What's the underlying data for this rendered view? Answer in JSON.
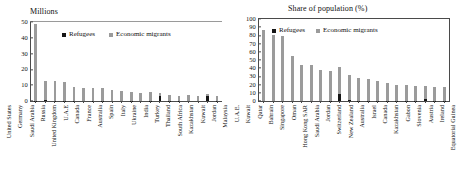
{
  "figure": {
    "legend": {
      "refugees_label": "Refugees",
      "economic_label": "Economic migrants",
      "refugees_color": "#161616",
      "economic_color": "#9b9b9b"
    }
  },
  "chart_data": [
    {
      "type": "bar",
      "title": "Millions",
      "xlabel": "",
      "ylabel": "Millions",
      "ylim": [
        0,
        50
      ],
      "yticks": [
        0,
        10,
        20,
        30,
        40,
        50
      ],
      "grid": false,
      "legend_position": "top-center",
      "stacked": true,
      "categories": [
        "United States",
        "Germany",
        "Saudi Arabia",
        "Russia",
        "United Kingdom",
        "U.A.E",
        "Canada",
        "France",
        "Australia",
        "Spain",
        "Italy",
        "Ukraine",
        "India",
        "Turkey",
        "Thailand",
        "South Africa",
        "Kazakhstan",
        "Kuwait",
        "Jordan",
        "Malaysia"
      ],
      "series": [
        {
          "name": "Economic migrants",
          "values": [
            47.0,
            11.5,
            12.2,
            11.6,
            8.5,
            8.1,
            7.8,
            7.5,
            6.7,
            5.9,
            5.7,
            4.9,
            5.2,
            2.0,
            3.6,
            3.1,
            3.5,
            2.9,
            1.4,
            3.3
          ]
        },
        {
          "name": "Refugees",
          "values": [
            0.3,
            0.6,
            0.1,
            0.3,
            0.1,
            0.0,
            0.1,
            0.3,
            0.0,
            0.0,
            0.1,
            0.0,
            0.2,
            3.0,
            0.1,
            0.1,
            0.0,
            0.0,
            2.9,
            0.1
          ]
        }
      ]
    },
    {
      "type": "bar",
      "title": "Share of population (%)",
      "xlabel": "",
      "ylabel": "Share of population (%)",
      "ylim": [
        0,
        100
      ],
      "yticks": [
        0,
        10,
        20,
        30,
        40,
        50,
        60,
        70,
        80,
        90,
        100
      ],
      "grid": false,
      "legend_position": "top-center",
      "stacked": true,
      "categories": [
        "U.A.E.",
        "Kuwait",
        "Qatar",
        "Bahrain",
        "Singapore",
        "Oman",
        "Hong Kong SAR",
        "Saudi Arabia",
        "Jordan",
        "Switzerland",
        "New Zealand",
        "Australia",
        "Israel",
        "Canada",
        "Kazakhstan",
        "Gabon",
        "Slovenia",
        "Austria",
        "Ireland",
        "Equatorial Guinea"
      ],
      "series": [
        {
          "name": "Economic migrants",
          "values": [
            88.0,
            81.0,
            80.0,
            55.0,
            45.0,
            44.0,
            38.0,
            37.0,
            33.0,
            31.0,
            28.0,
            27.5,
            24.5,
            22.0,
            20.0,
            19.5,
            19.0,
            16.0,
            17.5,
            17.5
          ]
        },
        {
          "name": "Refugees",
          "values": [
            0.0,
            0.0,
            0.0,
            0.0,
            0.0,
            0.0,
            0.0,
            0.3,
            9.0,
            1.0,
            0.2,
            0.2,
            0.3,
            0.4,
            0.2,
            0.1,
            0.1,
            2.0,
            0.3,
            0.1
          ]
        }
      ]
    }
  ]
}
